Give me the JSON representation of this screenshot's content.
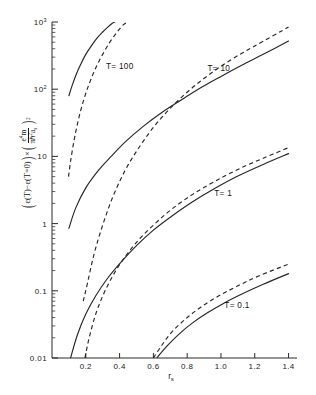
{
  "figure": {
    "background_color": "#ffffff",
    "ink_color": "#262626"
  },
  "axes": {
    "x": {
      "label_main": "r",
      "label_sub": "s",
      "scale": "linear",
      "min": 0.0,
      "max": 1.45,
      "major_ticks": [
        0.2,
        0.4,
        0.6,
        0.8,
        1.0,
        1.2,
        1.4
      ],
      "tick_labels": [
        "0.2",
        "0.4",
        "0.6",
        "0.8",
        "1.0",
        "1.2",
        "1.4"
      ],
      "minor_tick_step": 0.05
    },
    "y": {
      "scale": "log",
      "min": 0.01,
      "max": 1000,
      "major_ticks": [
        0.01,
        0.1,
        1,
        10,
        100,
        1000
      ],
      "tick_labels": [
        "0.01",
        "0.1",
        "1",
        "10",
        "10",
        "10"
      ],
      "tick_label_parts": [
        {
          "mantissa": "0.01",
          "exponent": ""
        },
        {
          "mantissa": "0.1",
          "exponent": ""
        },
        {
          "mantissa": "1",
          "exponent": ""
        },
        {
          "mantissa": "10",
          "exponent": ""
        },
        {
          "mantissa": "10",
          "exponent": "2"
        },
        {
          "mantissa": "10",
          "exponent": "3"
        }
      ],
      "label_text": "(E(T)-E(T=0))x(e4m / ph2as)2",
      "label_parts": {
        "lead_paren_open": "(",
        "epsilon1": "ε(T)",
        "minus": "−",
        "epsilon2": "ε(T=0)",
        "lead_paren_close": ")",
        "times": "×",
        "frac_paren_open": "(",
        "numerator": "e",
        "numerator_sup": "4",
        "numerator_tail": "m",
        "denominator": "πℏ",
        "denominator_sup": "2",
        "denominator_tail": "a",
        "denominator_sub": "s",
        "frac_paren_close": ")",
        "outer_exponent": "2"
      }
    },
    "grid": false,
    "legend": "inline-curve-labels"
  },
  "curve_labels": [
    {
      "text": "T= 100",
      "x": 0.32,
      "y_value": 200
    },
    {
      "text": "T= 10",
      "x": 0.92,
      "y_value": 185
    },
    {
      "text": "T= 1",
      "x": 0.96,
      "y_value": 2.6
    },
    {
      "text": "T= 0.1",
      "x": 1.02,
      "y_value": 0.055
    }
  ],
  "chart_data": {
    "type": "line",
    "title": "",
    "xlabel": "r_s",
    "ylabel": "(ε(T)-ε(T=0))×(e⁴m/πℏ²aₛ)²",
    "xscale": "linear",
    "yscale": "log",
    "xlim": [
      0.0,
      1.45
    ],
    "ylim": [
      0.01,
      1000
    ],
    "grid": false,
    "legend_position": "inline",
    "annotations": [
      "T= 100",
      "T= 10",
      "T= 1",
      "T= 0.1"
    ],
    "series": [
      {
        "name": "T= 100 (solid)",
        "style": "solid",
        "x": [
          0.1,
          0.12,
          0.145,
          0.17,
          0.2,
          0.235,
          0.27,
          0.3,
          0.33,
          0.355,
          0.372
        ],
        "y": [
          80,
          115,
          170,
          235,
          330,
          450,
          590,
          710,
          840,
          950,
          1000
        ]
      },
      {
        "name": "T= 100 (dashed)",
        "style": "dashed",
        "x": [
          0.098,
          0.11,
          0.13,
          0.155,
          0.185,
          0.22,
          0.26,
          0.3,
          0.34,
          0.38,
          0.42,
          0.45
        ],
        "y": [
          5.0,
          8.5,
          17,
          34,
          66,
          120,
          210,
          330,
          490,
          680,
          900,
          1000
        ]
      },
      {
        "name": "T= 10 (solid)",
        "style": "solid",
        "x": [
          0.1,
          0.14,
          0.2,
          0.27,
          0.35,
          0.44,
          0.54,
          0.65,
          0.76,
          0.88,
          1.0,
          1.12,
          1.25,
          1.4
        ],
        "y": [
          0.85,
          1.7,
          3.4,
          6.0,
          10.0,
          17.0,
          28.0,
          45.0,
          68.0,
          105,
          155,
          225,
          330,
          520
        ]
      },
      {
        "name": "T= 10 (dashed)",
        "style": "dashed",
        "x": [
          0.185,
          0.21,
          0.25,
          0.3,
          0.36,
          0.43,
          0.51,
          0.6,
          0.7,
          0.81,
          0.93,
          1.06,
          1.2,
          1.4
        ],
        "y": [
          0.07,
          0.13,
          0.36,
          0.95,
          2.5,
          6.0,
          13.0,
          27.0,
          52.0,
          95.0,
          165,
          275,
          440,
          840
        ]
      },
      {
        "name": "T= 1 (solid)",
        "style": "solid",
        "x": [
          0.11,
          0.15,
          0.2,
          0.26,
          0.33,
          0.41,
          0.5,
          0.6,
          0.71,
          0.83,
          0.96,
          1.1,
          1.25,
          1.4
        ],
        "y": [
          0.01,
          0.022,
          0.045,
          0.085,
          0.155,
          0.27,
          0.47,
          0.8,
          1.3,
          2.1,
          3.3,
          5.1,
          7.6,
          11.0
        ]
      },
      {
        "name": "T= 1 (dashed)",
        "style": "dashed",
        "x": [
          0.195,
          0.22,
          0.26,
          0.31,
          0.37,
          0.44,
          0.52,
          0.61,
          0.71,
          0.83,
          0.96,
          1.1,
          1.25,
          1.4
        ],
        "y": [
          0.01,
          0.02,
          0.046,
          0.095,
          0.185,
          0.34,
          0.6,
          1.0,
          1.65,
          2.7,
          4.2,
          6.4,
          9.4,
          13.5
        ]
      },
      {
        "name": "T= 0.1 (solid)",
        "style": "solid",
        "x": [
          0.62,
          0.68,
          0.75,
          0.83,
          0.92,
          1.02,
          1.13,
          1.25,
          1.4
        ],
        "y": [
          0.01,
          0.015,
          0.0225,
          0.033,
          0.047,
          0.066,
          0.091,
          0.125,
          0.18
        ]
      },
      {
        "name": "T= 0.1 (dashed)",
        "style": "dashed",
        "x": [
          0.6,
          0.65,
          0.71,
          0.79,
          0.88,
          0.98,
          1.09,
          1.22,
          1.4
        ],
        "y": [
          0.01,
          0.0155,
          0.0245,
          0.038,
          0.057,
          0.082,
          0.115,
          0.165,
          0.25
        ]
      }
    ]
  }
}
